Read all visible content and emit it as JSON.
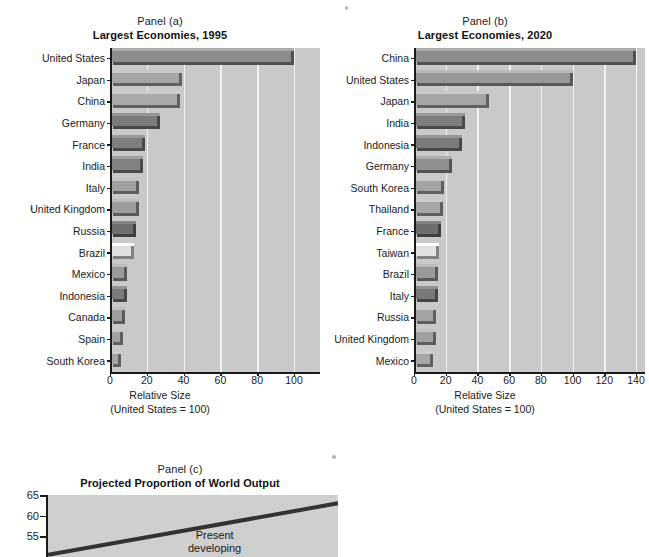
{
  "figure": {
    "background_color": "#ffffff",
    "plot_background_color": "#c9c9c9",
    "gridline_color": "#f2f2f2",
    "axis_color": "#1a1a1a"
  },
  "panel_a": {
    "panel_label": "Panel (a)",
    "title": "Largest Economies, 1995",
    "xlabel_line1": "Relative Size",
    "xlabel_line2": "(United States = 100)"
  },
  "panel_b": {
    "panel_label": "Panel (b)",
    "title": "Largest Economies, 2020",
    "xlabel_line1": "Relative Size",
    "xlabel_line2": "(United States = 100)"
  },
  "panel_c": {
    "panel_label": "Panel (c)",
    "title": "Projected Proportion of World Output",
    "annotation_line1": "Present",
    "annotation_line2": "developing"
  },
  "chart_data": [
    {
      "id": "panel-a",
      "type": "bar",
      "orientation": "horizontal",
      "title": "Largest Economies, 1995",
      "panel": "Panel (a)",
      "xlabel": "Relative Size (United States = 100)",
      "ylabel": "",
      "xlim": [
        0,
        100
      ],
      "xticks": [
        0,
        20,
        40,
        60,
        80,
        100
      ],
      "grid": true,
      "legend": "none",
      "categories": [
        "United States",
        "Japan",
        "China",
        "Germany",
        "France",
        "India",
        "Italy",
        "United Kingdom",
        "Russia",
        "Brazil",
        "Mexico",
        "Indonesia",
        "Canada",
        "Spain",
        "South Korea"
      ],
      "values": [
        100,
        39,
        38,
        27,
        19,
        18,
        16,
        16,
        14,
        13,
        9,
        9,
        8,
        7,
        6
      ],
      "bar_colors": [
        "#8c8c8c",
        "#a5a5a5",
        "#a8a8a8",
        "#7b7b7b",
        "#7f7f7f",
        "#828282",
        "#a0a0a0",
        "#9c9c9c",
        "#6f6f6f",
        "#e0e0e0",
        "#9a9a9a",
        "#7a7a7a",
        "#9e9e9e",
        "#a2a2a2",
        "#a6a6a6"
      ]
    },
    {
      "id": "panel-b",
      "type": "bar",
      "orientation": "horizontal",
      "title": "Largest Economies, 2020",
      "panel": "Panel (b)",
      "xlabel": "Relative Size (United States = 100)",
      "ylabel": "",
      "xlim": [
        0,
        140
      ],
      "xticks": [
        0,
        20,
        40,
        60,
        80,
        100,
        120,
        140
      ],
      "grid": true,
      "legend": "none",
      "categories": [
        "China",
        "United States",
        "Japan",
        "India",
        "Indonesia",
        "Germany",
        "South Korea",
        "Thailand",
        "France",
        "Taiwan",
        "Brazil",
        "Italy",
        "Russia",
        "United Kingdom",
        "Mexico"
      ],
      "values": [
        140,
        100,
        47,
        32,
        30,
        24,
        19,
        18,
        17,
        16,
        15,
        15,
        14,
        14,
        12
      ],
      "bar_colors": [
        "#8c8c8c",
        "#989898",
        "#a5a5a5",
        "#7e7e7e",
        "#7c7c7c",
        "#8f8f8f",
        "#a3a3a3",
        "#a6a6a6",
        "#6d6d6d",
        "#e2e2e2",
        "#999999",
        "#787878",
        "#a4a4a4",
        "#a0a0a0",
        "#a7a7a7"
      ]
    },
    {
      "id": "panel-c",
      "type": "line",
      "title": "Projected Proportion of World Output",
      "panel": "Panel (c)",
      "xlabel": "",
      "ylabel": "",
      "ylim": [
        50,
        65
      ],
      "yticks": [
        55,
        60,
        65
      ],
      "ytick_labels": [
        "55",
        "60",
        "65"
      ],
      "grid": false,
      "legend": "none",
      "annotations": [
        "Present developing"
      ],
      "series": [
        {
          "name": "Present developing",
          "x": [
            0,
            1
          ],
          "y": [
            50.5,
            63.0
          ]
        }
      ]
    }
  ]
}
